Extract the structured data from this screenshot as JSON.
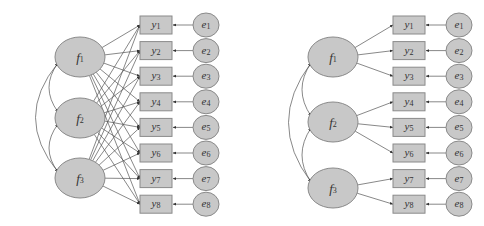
{
  "diagrams": [
    {
      "name": "cross-loading-model",
      "factors": [
        {
          "id": "f1",
          "label": "f",
          "sub": "1",
          "cx": 80,
          "cy": 57
        },
        {
          "id": "f2",
          "label": "f",
          "sub": "2",
          "cx": 80,
          "cy": 118
        },
        {
          "id": "f3",
          "label": "f",
          "sub": "3",
          "cx": 80,
          "cy": 178
        }
      ],
      "observed": [
        {
          "label": "y",
          "sub": "1"
        },
        {
          "label": "y",
          "sub": "2"
        },
        {
          "label": "y",
          "sub": "3"
        },
        {
          "label": "y",
          "sub": "4"
        },
        {
          "label": "y",
          "sub": "5"
        },
        {
          "label": "y",
          "sub": "6"
        },
        {
          "label": "y",
          "sub": "7"
        },
        {
          "label": "y",
          "sub": "8"
        }
      ],
      "errors": [
        {
          "label": "e",
          "sub": "1"
        },
        {
          "label": "e",
          "sub": "2"
        },
        {
          "label": "e",
          "sub": "3"
        },
        {
          "label": "e",
          "sub": "4"
        },
        {
          "label": "e",
          "sub": "5"
        },
        {
          "label": "e",
          "sub": "6"
        },
        {
          "label": "e",
          "sub": "7"
        },
        {
          "label": "e",
          "sub": "8"
        }
      ],
      "box_x": 140,
      "err_cx": 206,
      "loadings": "all-factors-to-all-items"
    },
    {
      "name": "simple-structure-model",
      "factors": [
        {
          "id": "f1",
          "label": "f",
          "sub": "1",
          "cx": 333,
          "cy": 57
        },
        {
          "id": "f2",
          "label": "f",
          "sub": "2",
          "cx": 333,
          "cy": 122
        },
        {
          "id": "f3",
          "label": "f",
          "sub": "3",
          "cx": 333,
          "cy": 188
        }
      ],
      "observed": [
        {
          "label": "y",
          "sub": "1"
        },
        {
          "label": "y",
          "sub": "2"
        },
        {
          "label": "y",
          "sub": "3"
        },
        {
          "label": "y",
          "sub": "4"
        },
        {
          "label": "y",
          "sub": "5"
        },
        {
          "label": "y",
          "sub": "6"
        },
        {
          "label": "y",
          "sub": "7"
        },
        {
          "label": "y",
          "sub": "8"
        }
      ],
      "errors": [
        {
          "label": "e",
          "sub": "1"
        },
        {
          "label": "e",
          "sub": "2"
        },
        {
          "label": "e",
          "sub": "3"
        },
        {
          "label": "e",
          "sub": "4"
        },
        {
          "label": "e",
          "sub": "5"
        },
        {
          "label": "e",
          "sub": "6"
        },
        {
          "label": "e",
          "sub": "7"
        },
        {
          "label": "e",
          "sub": "8"
        }
      ],
      "box_x": 393,
      "err_cx": 459,
      "loadings": {
        "f1": [
          1,
          2,
          3
        ],
        "f2": [
          4,
          5,
          6
        ],
        "f3": [
          7,
          8
        ]
      }
    }
  ]
}
